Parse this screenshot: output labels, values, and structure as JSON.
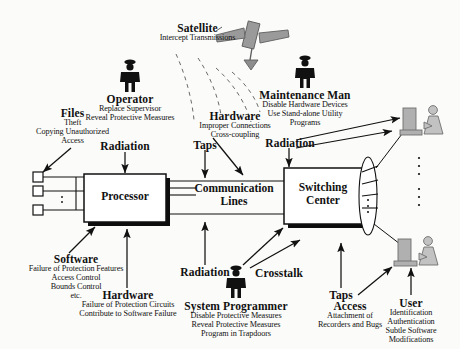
{
  "diagram": {
    "background_color": "#fbfbf9",
    "ink_color": "#111111",
    "satellite_color": "#9a9a9a",
    "terminal_color": "#b5b5b5"
  },
  "nodes": {
    "processor": {
      "label": "Processor"
    },
    "communication_lines": {
      "label_line1": "Communication",
      "label_line2": "Lines"
    },
    "switching_center": {
      "label_line1": "Switching",
      "label_line2": "Center"
    }
  },
  "threats": [
    {
      "id": "satellite",
      "heading": "Satellite",
      "details": [
        "Intercept Transmissions"
      ]
    },
    {
      "id": "operator",
      "heading": "Operator",
      "details": [
        "Replace Supervisor",
        "Reveal Protective Measures"
      ]
    },
    {
      "id": "maintenance-man",
      "heading": "Maintenance Man",
      "details": [
        "Disable Hardware Devices",
        "Use Stand-alone Utility",
        "Programs"
      ]
    },
    {
      "id": "files",
      "heading": "Files",
      "details": [
        "Theft",
        "Copying Unauthorized",
        "Access"
      ]
    },
    {
      "id": "hardware-top",
      "heading": "Hardware",
      "details": [
        "Improper Connections",
        "Cross-coupling"
      ]
    },
    {
      "id": "radiation-processor",
      "heading": "Radiation",
      "details": []
    },
    {
      "id": "radiation-comm",
      "heading": "Radiation",
      "details": []
    },
    {
      "id": "radiation-switching",
      "heading": "Radiation",
      "details": []
    },
    {
      "id": "taps-top",
      "heading": "Taps",
      "details": []
    },
    {
      "id": "taps-bottom",
      "heading": "Taps",
      "details": []
    },
    {
      "id": "crosstalk",
      "heading": "Crosstalk",
      "details": []
    },
    {
      "id": "software",
      "heading": "Software",
      "details": [
        "Failure of Protection Features",
        "Access Control",
        "Bounds Control",
        "etc."
      ]
    },
    {
      "id": "hardware-bottom",
      "heading": "Hardware",
      "details": [
        "Failure of Protection Circuits",
        "Contribute to Software Failure"
      ]
    },
    {
      "id": "system-programmer",
      "heading": "System Programmer",
      "details": [
        "Disable Protective Measures",
        "Reveal Protective Measures",
        "Program in Trapdoors"
      ]
    },
    {
      "id": "access",
      "heading": "Access",
      "details": [
        "Attachment of",
        "Recorders and Bugs"
      ]
    },
    {
      "id": "user",
      "heading": "User",
      "details": [
        "Identification",
        "Authentication",
        "Subtle Software",
        "Modifications"
      ]
    }
  ]
}
